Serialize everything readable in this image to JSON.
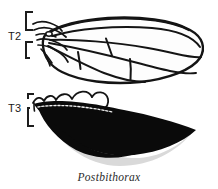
{
  "figure": {
    "caption": "Postbithorax",
    "background_color": "#ffffff",
    "ink_color": "#141414",
    "segments": [
      {
        "id": "T2",
        "label": "T2",
        "description": "normal mesothoracic wing, outline drawing with wing venation",
        "rendering": "line-art"
      },
      {
        "id": "T3",
        "label": "T3",
        "description": "transformed metathoracic appendage, solid black wing silhouette",
        "rendering": "solid-black"
      }
    ]
  },
  "labels": {
    "t2": "T2",
    "t3": "T3"
  },
  "caption": {
    "text": "Postbithorax"
  }
}
